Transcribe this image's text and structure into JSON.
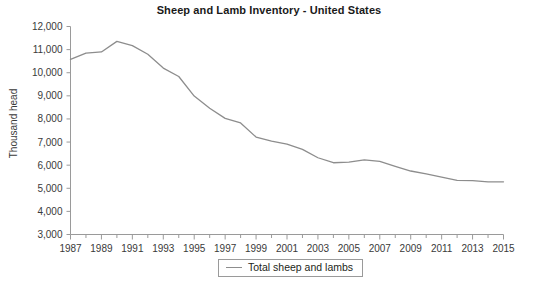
{
  "chart_data": {
    "type": "line",
    "title": "Sheep and Lamb Inventory - United States",
    "xlabel": "",
    "ylabel": "Thousand head",
    "ylim": [
      3000,
      12000
    ],
    "ytick_step": 1000,
    "ytick_labels": [
      "12,000",
      "11,000",
      "10,000",
      "9,000",
      "8,000",
      "7,000",
      "6,000",
      "5,000",
      "4,000",
      "3,000"
    ],
    "ytick_values": [
      12000,
      11000,
      10000,
      9000,
      8000,
      7000,
      6000,
      5000,
      4000,
      3000
    ],
    "xlim": [
      1987,
      2015
    ],
    "xtick_labels": [
      "1987",
      "1989",
      "1991",
      "1993",
      "1995",
      "1997",
      "1999",
      "2001",
      "2003",
      "2005",
      "2007",
      "2009",
      "2011",
      "2013",
      "2015"
    ],
    "xtick_values": [
      1987,
      1989,
      1991,
      1993,
      1995,
      1997,
      1999,
      2001,
      2003,
      2005,
      2007,
      2009,
      2011,
      2013,
      2015
    ],
    "minor_xticks_every": 1,
    "grid": false,
    "legend_position": "bottom-center",
    "line_color": "#8d8d8d",
    "axis_color": "#9a9a9a",
    "x": [
      1987,
      1988,
      1989,
      1990,
      1991,
      1992,
      1993,
      1994,
      1995,
      1996,
      1997,
      1998,
      1999,
      2000,
      2001,
      2002,
      2003,
      2004,
      2005,
      2006,
      2007,
      2008,
      2009,
      2010,
      2011,
      2012,
      2013,
      2014,
      2015
    ],
    "series": [
      {
        "name": "Total sheep and lambs",
        "values": [
          10575,
          10850,
          10900,
          11358,
          11175,
          10800,
          10201,
          9836,
          8989,
          8465,
          8024,
          7825,
          7215,
          7036,
          6908,
          6685,
          6321,
          6105,
          6135,
          6230,
          6165,
          5950,
          5747,
          5620,
          5480,
          5345,
          5335,
          5280,
          5280
        ]
      }
    ]
  }
}
